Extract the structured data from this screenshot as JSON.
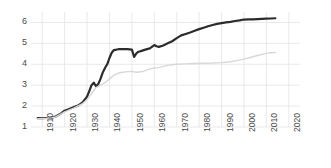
{
  "chart_data": {
    "type": "line",
    "title": "",
    "subtitle": "",
    "xlabel": "",
    "ylabel": "",
    "xlim": [
      1905,
      2025
    ],
    "ylim": [
      1,
      6.5
    ],
    "grid": true,
    "legend": "none",
    "annotations": [],
    "xticks": [
      "1910",
      "1920",
      "1930",
      "1940",
      "1950",
      "1960",
      "1970",
      "1980",
      "1990",
      "2000",
      "2010",
      "2020"
    ],
    "yticks": [
      "1",
      "2",
      "3",
      "4",
      "5",
      "6"
    ],
    "series": [
      {
        "name": "primary",
        "color": "#2b2b2b",
        "width": 2.2,
        "x": [
          1908,
          1910,
          1912,
          1914,
          1916,
          1918,
          1920,
          1922,
          1924,
          1926,
          1928,
          1930,
          1931,
          1932,
          1933,
          1934,
          1935,
          1936,
          1937,
          1938,
          1939,
          1940,
          1941,
          1942,
          1944,
          1946,
          1948,
          1950,
          1951,
          1952,
          1953,
          1954,
          1956,
          1958,
          1960,
          1961,
          1962,
          1964,
          1966,
          1968,
          1970,
          1972,
          1974,
          1976,
          1978,
          1980,
          1982,
          1984,
          1986,
          1988,
          1990,
          1992,
          1994,
          1996,
          1998,
          2000,
          2002,
          2004,
          2006,
          2008,
          2010,
          2012,
          2014
        ],
        "values": [
          1.42,
          1.42,
          1.43,
          1.45,
          1.5,
          1.62,
          1.78,
          1.86,
          1.95,
          2.02,
          2.18,
          2.45,
          2.72,
          3.0,
          3.12,
          2.95,
          3.05,
          3.3,
          3.6,
          3.82,
          4.0,
          4.3,
          4.55,
          4.68,
          4.72,
          4.73,
          4.72,
          4.7,
          4.35,
          4.52,
          4.6,
          4.63,
          4.7,
          4.76,
          4.92,
          4.86,
          4.83,
          4.9,
          5.0,
          5.1,
          5.25,
          5.38,
          5.45,
          5.52,
          5.6,
          5.68,
          5.75,
          5.82,
          5.88,
          5.93,
          5.97,
          6.0,
          6.03,
          6.07,
          6.1,
          6.14,
          6.15,
          6.15,
          6.16,
          6.17,
          6.18,
          6.19,
          6.2
        ]
      },
      {
        "name": "secondary",
        "color": "#d8d8d8",
        "width": 1.4,
        "x": [
          1908,
          1912,
          1916,
          1920,
          1924,
          1928,
          1930,
          1932,
          1934,
          1936,
          1938,
          1940,
          1942,
          1944,
          1946,
          1948,
          1950,
          1952,
          1954,
          1956,
          1958,
          1960,
          1962,
          1964,
          1966,
          1968,
          1970,
          1974,
          1978,
          1982,
          1986,
          1990,
          1994,
          1998,
          2002,
          2006,
          2010,
          2012,
          2014
        ],
        "values": [
          1.4,
          1.42,
          1.48,
          1.72,
          1.9,
          2.12,
          2.3,
          2.6,
          2.88,
          3.0,
          3.12,
          3.3,
          3.48,
          3.58,
          3.62,
          3.65,
          3.66,
          3.62,
          3.64,
          3.7,
          3.78,
          3.82,
          3.84,
          3.9,
          3.95,
          3.98,
          4.0,
          4.02,
          4.04,
          4.05,
          4.06,
          4.08,
          4.12,
          4.2,
          4.3,
          4.42,
          4.52,
          4.55,
          4.56
        ]
      }
    ]
  },
  "axis": {
    "y_label_color": "#4a4a4a",
    "x_label_color": "#4a4a4a",
    "grid_color": "#e3e3e3",
    "background": "#ffffff"
  }
}
